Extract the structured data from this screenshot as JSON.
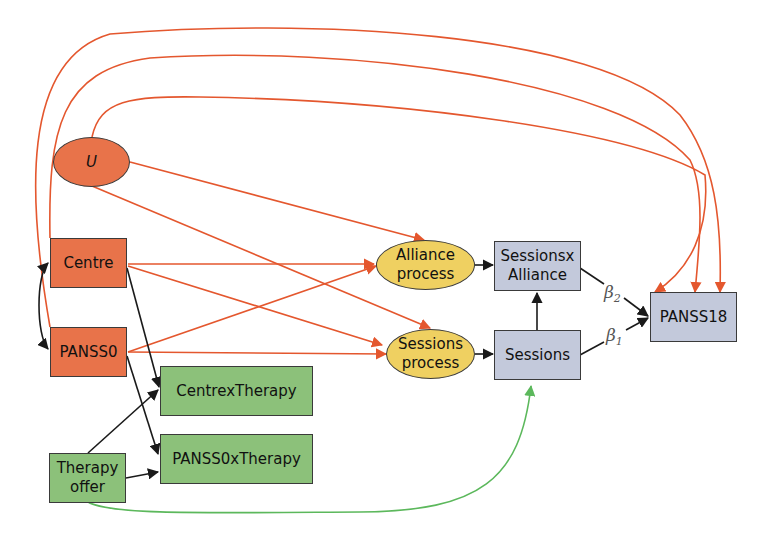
{
  "diagram": {
    "type": "causal path diagram",
    "colors": {
      "confounder_edge": "#e4572e",
      "instrument_edge": "#5cb85c",
      "causal_edge": "#1a1a1a",
      "baseline_fill": "#e8734a",
      "process_fill": "#efd061",
      "therapy_fill": "#8cc17a",
      "outcome_fill": "#c3c9db"
    },
    "nodes": {
      "u": {
        "label": "U",
        "shape": "ellipse",
        "group": "unmeasured"
      },
      "centre": {
        "label": "Centre",
        "shape": "rect",
        "group": "baseline"
      },
      "panss0": {
        "label": "PANSS0",
        "shape": "rect",
        "group": "baseline"
      },
      "centre_x_therapy": {
        "label": "CentrexTherapy",
        "shape": "rect",
        "group": "therapy"
      },
      "panss0_x_therapy": {
        "label": "PANSS0xTherapy",
        "shape": "rect",
        "group": "therapy"
      },
      "therapy_offer": {
        "label_line1": "Therapy",
        "label_line2": "offer",
        "shape": "rect",
        "group": "therapy"
      },
      "alliance_process": {
        "label_line1": "Alliance",
        "label_line2": "process",
        "shape": "ellipse",
        "group": "process"
      },
      "sessions_process": {
        "label_line1": "Sessions",
        "label_line2": "process",
        "shape": "ellipse",
        "group": "process"
      },
      "sessions_x_alliance": {
        "label_line1": "Sessionsx",
        "label_line2": "Alliance",
        "shape": "rect",
        "group": "mediator"
      },
      "sessions": {
        "label": "Sessions",
        "shape": "rect",
        "group": "mediator"
      },
      "panss18": {
        "label": "PANSS18",
        "shape": "rect",
        "group": "outcome"
      }
    },
    "edge_labels": {
      "beta2": {
        "symbol": "β",
        "sub": "2"
      },
      "beta1": {
        "symbol": "β",
        "sub": "1"
      }
    },
    "edges": [
      {
        "from": "U",
        "to": "Alliance process",
        "color": "orange"
      },
      {
        "from": "U",
        "to": "Sessions process",
        "color": "orange"
      },
      {
        "from": "U",
        "to": "PANSS18",
        "color": "orange"
      },
      {
        "from": "Centre",
        "to": "PANSS18",
        "color": "orange"
      },
      {
        "from": "PANSS0",
        "to": "PANSS18",
        "color": "orange"
      },
      {
        "from": "Centre",
        "to": "Alliance process",
        "color": "orange"
      },
      {
        "from": "Centre",
        "to": "Sessions process",
        "color": "orange"
      },
      {
        "from": "PANSS0",
        "to": "Alliance process",
        "color": "orange"
      },
      {
        "from": "PANSS0",
        "to": "Sessions process",
        "color": "orange"
      },
      {
        "from": "Centre",
        "to": "PANSS0",
        "color": "black",
        "bidirectional": true
      },
      {
        "from": "Centre",
        "to": "CentrexTherapy",
        "color": "black"
      },
      {
        "from": "PANSS0",
        "to": "PANSS0xTherapy",
        "color": "black"
      },
      {
        "from": "Therapy offer",
        "to": "CentrexTherapy",
        "color": "black"
      },
      {
        "from": "Therapy offer",
        "to": "PANSS0xTherapy",
        "color": "black"
      },
      {
        "from": "Therapy offer",
        "to": "Sessions",
        "color": "green"
      },
      {
        "from": "Alliance process",
        "to": "Sessionsx Alliance",
        "color": "black"
      },
      {
        "from": "Sessions process",
        "to": "Sessions",
        "color": "black"
      },
      {
        "from": "Sessions",
        "to": "Sessionsx Alliance",
        "color": "black"
      },
      {
        "from": "Sessionsx Alliance",
        "to": "PANSS18",
        "color": "black",
        "label": "β2"
      },
      {
        "from": "Sessions",
        "to": "PANSS18",
        "color": "black",
        "label": "β1"
      }
    ]
  }
}
